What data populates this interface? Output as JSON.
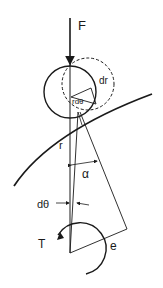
{
  "diagram": {
    "labels": {
      "force": "F",
      "dr": "dr",
      "rdtheta": "rdθ",
      "radius": "r",
      "alpha": "α",
      "dtheta": "dθ",
      "torque": "T",
      "eccentricity": "e"
    },
    "colors": {
      "stroke": "#1a1a1a",
      "background": "#ffffff"
    }
  }
}
